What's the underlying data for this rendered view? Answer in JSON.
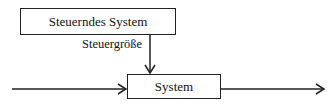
{
  "diagram": {
    "controller_box": {
      "label": "Steuerndes System"
    },
    "system_box": {
      "label": "System"
    },
    "control_variable_label": "Steuergröße",
    "arrows": [
      {
        "from": "input",
        "to": "System"
      },
      {
        "from": "Steuerndes System",
        "to": "System",
        "label": "Steuergröße"
      },
      {
        "from": "System",
        "to": "output"
      }
    ],
    "line_color": "#222222"
  }
}
